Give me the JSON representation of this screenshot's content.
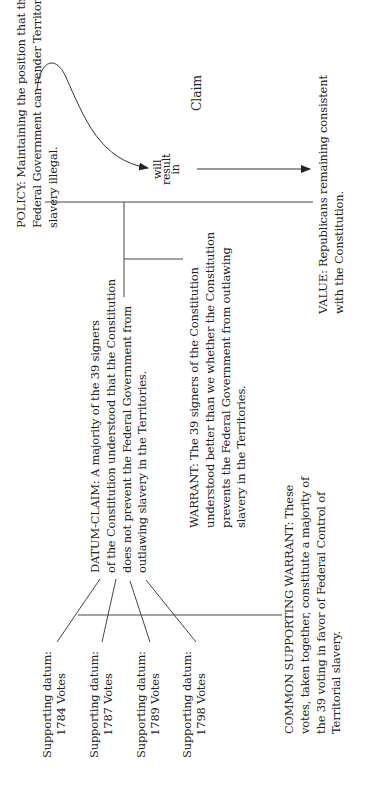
{
  "diagram": {
    "policy": {
      "lines": [
        "POLICY:  Maintaining the position that the",
        "Federal Government can render Territorial",
        "slavery illegal."
      ]
    },
    "connector": {
      "lines": [
        "will",
        "result",
        "in"
      ]
    },
    "claim_label": "Claim",
    "value": {
      "lines": [
        "VALUE:  Republicans remaining consistent",
        "with the Constitution."
      ]
    },
    "datum_claim": {
      "lines": [
        "DATUM-CLAIM: A majority of the 39 signers",
        "of the Constitution understood that the Constitution",
        "does not prevent the Federal Government from",
        "outlawing slavery in the Territories."
      ]
    },
    "warrant": {
      "lines": [
        "WARRANT:  The 39 signers of the Constitution",
        "understood better than we whether the Constitution",
        "prevents the Federal Government from outlawing",
        "slavery in the Territories."
      ]
    },
    "common_warrant": {
      "lines": [
        "COMMON SUPPORTING WARRANT:  These",
        "votes, taken together, constitute a majority of",
        "the 39 voting in favor of Federal Control of",
        "Territorial slavery."
      ]
    },
    "supporting_data": [
      {
        "label": "Supporting datum:",
        "votes": "1784 Votes"
      },
      {
        "label": "Supporting datum:",
        "votes": "1787 Votes"
      },
      {
        "label": "Supporting datum:",
        "votes": "1789 Votes"
      },
      {
        "label": "Supporting datum:",
        "votes": "1798 Votes"
      }
    ]
  }
}
